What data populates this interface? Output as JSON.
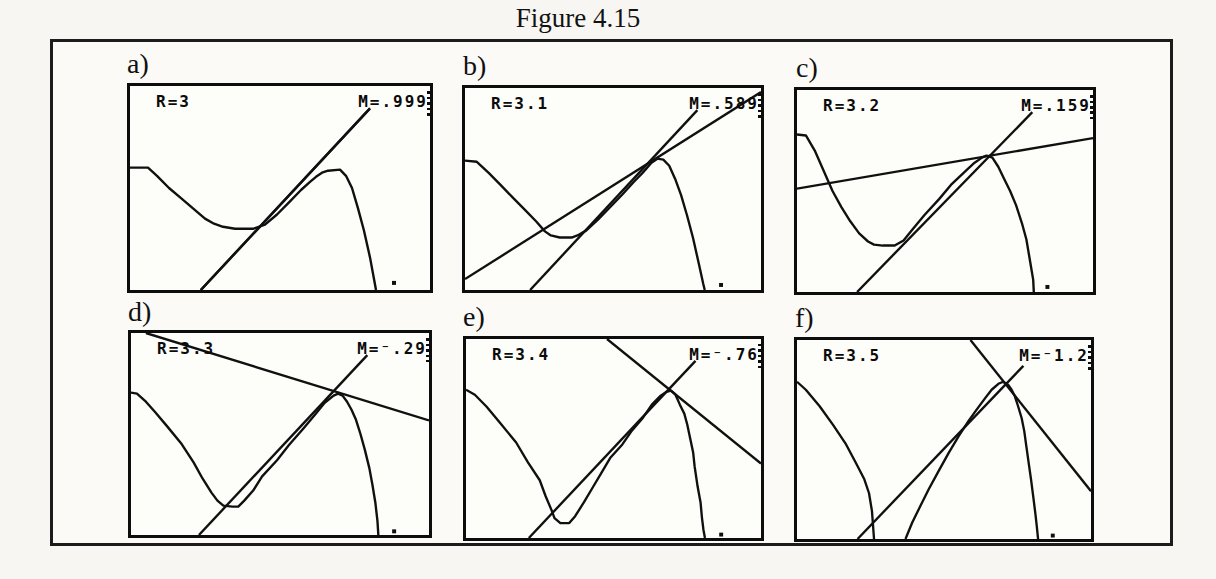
{
  "chart_data": {
    "type": "line",
    "title": "Figure 4.15",
    "coordinates_note": "Point coordinates are percent of the screen plotting area: x measured left-to-right, y measured top-down.",
    "R_values": [
      3,
      3.1,
      3.2,
      3.3,
      3.4,
      3.5
    ],
    "M_values": [
      0.999,
      0.589,
      0.159,
      -0.29,
      -0.76,
      -1.2
    ],
    "axes": {
      "visible": false,
      "grid": false,
      "legend": "none"
    },
    "panels": [
      {
        "label": "a)",
        "R": 3,
        "M": 0.999,
        "r_text": "R=3",
        "m_text": "M=.999",
        "identity_line": [
          [
            23.6,
            100
          ],
          [
            80,
            11
          ]
        ],
        "tangent_line": [
          [
            23.6,
            100
          ],
          [
            80,
            11
          ]
        ],
        "curves": [
          [
            [
              0,
              40
            ],
            [
              6,
              40
            ],
            [
              9,
              44
            ],
            [
              13,
              50
            ],
            [
              17,
              55
            ],
            [
              21,
              60
            ],
            [
              25,
              65
            ],
            [
              28,
              67.5
            ],
            [
              31,
              69
            ],
            [
              35,
              70
            ],
            [
              41,
              70
            ],
            [
              45,
              68
            ],
            [
              49,
              63
            ],
            [
              53,
              57
            ],
            [
              57,
              51
            ],
            [
              60,
              47
            ],
            [
              62,
              44.5
            ],
            [
              64,
              42.5
            ],
            [
              66,
              41.5
            ],
            [
              70,
              41
            ],
            [
              72,
              44
            ],
            [
              74,
              50
            ],
            [
              76,
              60
            ],
            [
              78,
              71
            ],
            [
              80,
              84
            ],
            [
              81.5,
              96
            ],
            [
              82,
              100
            ]
          ]
        ],
        "dot": [
          88,
          96.5
        ]
      },
      {
        "label": "b)",
        "R": 3.1,
        "M": 0.589,
        "r_text": "R=3.1",
        "m_text": "M=.589",
        "identity_line": [
          [
            22,
            100
          ],
          [
            78.5,
            11
          ]
        ],
        "tangent_line": [
          [
            0,
            94.6
          ],
          [
            100,
            2
          ]
        ],
        "curves": [
          [
            [
              0,
              36
            ],
            [
              4,
              36.5
            ],
            [
              8,
              42
            ],
            [
              12,
              48
            ],
            [
              16,
              54
            ],
            [
              20,
              60
            ],
            [
              24,
              66
            ],
            [
              27,
              71
            ],
            [
              29,
              73
            ],
            [
              32,
              74
            ],
            [
              36,
              74
            ],
            [
              38,
              73
            ],
            [
              41,
              70.5
            ],
            [
              45,
              65
            ],
            [
              49,
              59
            ],
            [
              53,
              53
            ],
            [
              57,
              46.5
            ],
            [
              60,
              42
            ],
            [
              63,
              37
            ],
            [
              65,
              35
            ],
            [
              67,
              35.5
            ],
            [
              69,
              38.5
            ],
            [
              71,
              45
            ],
            [
              73,
              53
            ],
            [
              75,
              63
            ],
            [
              77,
              74
            ],
            [
              79,
              87
            ],
            [
              80.5,
              97
            ],
            [
              81,
              100
            ]
          ]
        ],
        "dot": [
          86.5,
          97.5
        ]
      },
      {
        "label": "c)",
        "R": 3.2,
        "M": 0.159,
        "r_text": "R=3.2",
        "m_text": "M=.159",
        "identity_line": [
          [
            20.3,
            100
          ],
          [
            79.5,
            11
          ]
        ],
        "tangent_line": [
          [
            0,
            48.8
          ],
          [
            100,
            23.8
          ]
        ],
        "curves": [
          [
            [
              0,
              22
            ],
            [
              3,
              22.5
            ],
            [
              6,
              30
            ],
            [
              9,
              40
            ],
            [
              12,
              50
            ],
            [
              15,
              58
            ],
            [
              18,
              65
            ],
            [
              21,
              71
            ],
            [
              24,
              75
            ],
            [
              26,
              76.5
            ],
            [
              29,
              77
            ],
            [
              33,
              77
            ],
            [
              36,
              74.5
            ],
            [
              39,
              69
            ],
            [
              43,
              62
            ],
            [
              48,
              54
            ],
            [
              52,
              47
            ],
            [
              57,
              40
            ],
            [
              60,
              36
            ],
            [
              62.5,
              33.5
            ],
            [
              64,
              32.5
            ],
            [
              66,
              33.5
            ],
            [
              68,
              38
            ],
            [
              70,
              44
            ],
            [
              72,
              50
            ],
            [
              74,
              57
            ],
            [
              76,
              66
            ],
            [
              77.5,
              74
            ],
            [
              79,
              87
            ],
            [
              79.8,
              94
            ],
            [
              80,
              100
            ]
          ]
        ],
        "dot": [
          84.6,
          97.5
        ]
      },
      {
        "label": "d)",
        "R": 3.3,
        "M": -0.29,
        "r_text": "R=3.3",
        "m_text": "M=⁻.29",
        "identity_line": [
          [
            22.8,
            100
          ],
          [
            79.3,
            11
          ]
        ],
        "tangent_line": [
          [
            5,
            0
          ],
          [
            100,
            43.3
          ]
        ],
        "curves": [
          [
            [
              0,
              29.5
            ],
            [
              2,
              30
            ],
            [
              5,
              34
            ],
            [
              8,
              39
            ],
            [
              12,
              46
            ],
            [
              17,
              55
            ],
            [
              21,
              64
            ],
            [
              24,
              72
            ],
            [
              27,
              79
            ],
            [
              29,
              83
            ],
            [
              31,
              85.5
            ],
            [
              34,
              86
            ],
            [
              36,
              86
            ],
            [
              38,
              83
            ],
            [
              41,
              78
            ],
            [
              44,
              71
            ],
            [
              49,
              63
            ],
            [
              53,
              55.5
            ],
            [
              58,
              47
            ],
            [
              62,
              40
            ],
            [
              65,
              34.5
            ],
            [
              68,
              31
            ],
            [
              69.5,
              30
            ],
            [
              71,
              31
            ],
            [
              72.5,
              34
            ],
            [
              74,
              38
            ],
            [
              75.5,
              43
            ],
            [
              77,
              50
            ],
            [
              78.5,
              58
            ],
            [
              80,
              67
            ],
            [
              81,
              75
            ],
            [
              82,
              84
            ],
            [
              82.7,
              93
            ],
            [
              83,
              100
            ]
          ]
        ],
        "dot": [
          88.3,
          98.2
        ]
      },
      {
        "label": "e)",
        "R": 3.4,
        "M": -0.76,
        "r_text": "R=3.4",
        "m_text": "M=⁻.76",
        "identity_line": [
          [
            21.3,
            100
          ],
          [
            77.8,
            11
          ]
        ],
        "tangent_line": [
          [
            47.8,
            0
          ],
          [
            100,
            62.6
          ]
        ],
        "curves": [
          [
            [
              0,
              25.5
            ],
            [
              3,
              28
            ],
            [
              7,
              34
            ],
            [
              12,
              43
            ],
            [
              17,
              52
            ],
            [
              21,
              62
            ],
            [
              25,
              71
            ],
            [
              27,
              79
            ],
            [
              29,
              86
            ],
            [
              30,
              90
            ],
            [
              32,
              92.5
            ],
            [
              35,
              92.5
            ],
            [
              37,
              89
            ],
            [
              40,
              82
            ],
            [
              43,
              74.5
            ],
            [
              46,
              67
            ],
            [
              49,
              59.5
            ],
            [
              53,
              53
            ],
            [
              56,
              46.5
            ],
            [
              60,
              39.5
            ],
            [
              63,
              33
            ],
            [
              66,
              28.5
            ],
            [
              68,
              26.5
            ],
            [
              69.5,
              26
            ],
            [
              71,
              28
            ],
            [
              72.5,
              33
            ],
            [
              74,
              37.5
            ],
            [
              75,
              43
            ],
            [
              76,
              50
            ],
            [
              77,
              57
            ],
            [
              77.5,
              64
            ],
            [
              78.5,
              74
            ],
            [
              79.5,
              82
            ],
            [
              80,
              90
            ],
            [
              80.5,
              96
            ],
            [
              81,
              100
            ]
          ]
        ],
        "dot": [
          86.5,
          98.3
        ]
      },
      {
        "label": "f)",
        "R": 3.5,
        "M": -1.2,
        "r_text": "R=3.5",
        "m_text": "M=⁻1.2",
        "identity_line": [
          [
            20.6,
            100
          ],
          [
            77,
            13
          ]
        ],
        "tangent_line": [
          [
            59,
            0
          ],
          [
            100,
            76
          ]
        ],
        "curves": [
          [
            [
              0,
              21
            ],
            [
              3,
              25
            ],
            [
              7.7,
              33.3
            ],
            [
              12.2,
              42.5
            ],
            [
              16.7,
              52.5
            ],
            [
              20,
              61.7
            ],
            [
              22.9,
              70
            ],
            [
              24.5,
              77
            ],
            [
              25.5,
              86
            ],
            [
              26.2,
              100
            ]
          ],
          [
            [
              36.9,
              100
            ],
            [
              39.2,
              91.7
            ],
            [
              42,
              83.3
            ],
            [
              44.8,
              75
            ],
            [
              48.2,
              65.8
            ],
            [
              51.6,
              56.7
            ],
            [
              55,
              48.3
            ],
            [
              58.3,
              40.8
            ],
            [
              61.1,
              35
            ],
            [
              64,
              29.2
            ],
            [
              66.2,
              25
            ],
            [
              68.5,
              22
            ],
            [
              70.1,
              21
            ],
            [
              71.8,
              22.5
            ],
            [
              73,
              25
            ],
            [
              74.1,
              28.3
            ],
            [
              75.2,
              33.3
            ],
            [
              76.4,
              39.2
            ],
            [
              77.3,
              45.8
            ],
            [
              78,
              53.3
            ],
            [
              78.8,
              61.7
            ],
            [
              79.6,
              70
            ],
            [
              80.4,
              79.2
            ],
            [
              81.1,
              87.5
            ],
            [
              81.6,
              94.2
            ],
            [
              82,
              100
            ]
          ]
        ],
        "dot": [
          87,
          98.3
        ]
      }
    ]
  }
}
